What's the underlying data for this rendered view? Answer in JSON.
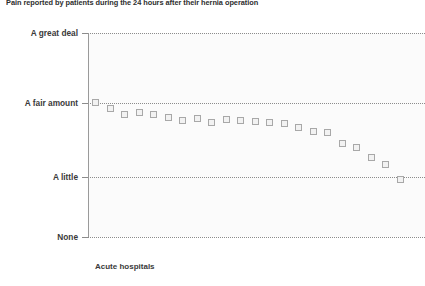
{
  "chart": {
    "title": "Pain reported by patients during the 24 hours after their hernia operation",
    "xlabel": "Acute hospitals"
  },
  "chart_data": {
    "type": "scatter",
    "title": "Pain reported by patients during the 24 hours after their hernia operation",
    "xlabel": "Acute hospitals",
    "ylabel": "",
    "grid": true,
    "legend": null,
    "y_categories": [
      "None",
      "A little",
      "A fair amount",
      "A great deal"
    ],
    "ylim": [
      0,
      3
    ],
    "y_tick_labels": [
      "A great deal",
      "A fair amount",
      "A little",
      "None"
    ],
    "y_tick_values": [
      3,
      2,
      1,
      0
    ],
    "marker": "square with 95% confidence interval whiskers",
    "x": [
      1,
      2,
      3,
      4,
      5,
      6,
      7,
      8,
      9,
      10,
      11,
      12,
      13,
      14,
      15,
      16,
      17,
      18,
      19,
      20,
      21,
      22
    ],
    "categories": [
      "Hospital 1",
      "Hospital 2",
      "Hospital 3",
      "Hospital 4",
      "Hospital 5",
      "Hospital 6",
      "Hospital 7",
      "Hospital 8",
      "Hospital 9",
      "Hospital 10",
      "Hospital 11",
      "Hospital 12",
      "Hospital 13",
      "Hospital 14",
      "Hospital 15",
      "Hospital 16",
      "Hospital 17",
      "Hospital 18",
      "Hospital 19",
      "Hospital 20",
      "Hospital 21",
      "Hospital 22"
    ],
    "series": [
      {
        "name": "Mean pain score",
        "values": [
          2.0,
          1.93,
          1.86,
          1.88,
          1.86,
          1.82,
          1.79,
          1.81,
          1.77,
          1.8,
          1.79,
          1.78,
          1.77,
          1.76,
          1.7,
          1.66,
          1.65,
          1.5,
          1.44,
          1.35,
          1.28,
          1.2
        ],
        "ci_low": [
          1.86,
          1.82,
          1.79,
          1.72,
          1.66,
          1.7,
          1.74,
          1.68,
          1.69,
          1.59,
          1.7,
          1.69,
          1.68,
          1.56,
          1.61,
          1.58,
          1.34,
          1.28,
          1.1,
          1.22,
          1.13
        ],
        "ci_high": [
          2.13,
          2.03,
          1.93,
          2.02,
          2.04,
          1.93,
          1.85,
          1.92,
          1.85,
          1.99,
          1.88,
          1.87,
          1.85,
          1.95,
          1.79,
          1.75,
          1.81,
          1.61,
          1.62,
          1.47,
          1.43,
          1.27
        ]
      }
    ]
  },
  "points": [
    {
      "x": 95,
      "mean": 103,
      "low": 92,
      "high": 114
    },
    {
      "x": 110,
      "mean": 109,
      "low": 100,
      "high": 117
    },
    {
      "x": 124,
      "mean": 115,
      "low": 109,
      "high": 121
    },
    {
      "x": 139,
      "mean": 113,
      "low": 99,
      "high": 125
    },
    {
      "x": 153,
      "mean": 115,
      "low": 96,
      "high": 132
    },
    {
      "x": 168,
      "mean": 118,
      "low": 108,
      "high": 128
    },
    {
      "x": 182,
      "mean": 121,
      "low": 114,
      "high": 126
    },
    {
      "x": 197,
      "mean": 119,
      "low": 110,
      "high": 130
    },
    {
      "x": 211,
      "mean": 123,
      "low": 115,
      "high": 129
    },
    {
      "x": 226,
      "mean": 120,
      "low": 103,
      "high": 137
    },
    {
      "x": 240,
      "mean": 121,
      "low": 113,
      "high": 128
    },
    {
      "x": 255,
      "mean": 122,
      "low": 114,
      "high": 130
    },
    {
      "x": 269,
      "mean": 123,
      "low": 115,
      "high": 130
    },
    {
      "x": 284,
      "mean": 124,
      "low": 107,
      "high": 140
    },
    {
      "x": 298,
      "mean": 128,
      "low": 119,
      "high": 137
    },
    {
      "x": 313,
      "mean": 132,
      "low": 124,
      "high": 140
    },
    {
      "x": 327,
      "mean": 133,
      "low": 113,
      "high": 152
    },
    {
      "x": 342,
      "mean": 144,
      "low": 136,
      "high": 152
    },
    {
      "x": 356,
      "mean": 148,
      "low": 139,
      "high": 157
    },
    {
      "x": 371,
      "mean": 158,
      "low": 146,
      "high": 170
    },
    {
      "x": 385,
      "mean": 165,
      "low": 152,
      "high": 181
    },
    {
      "x": 400,
      "mean": 180,
      "low": 172,
      "high": 192
    }
  ],
  "axis": {
    "y_labels": [
      {
        "text": "A great deal",
        "y": 33
      },
      {
        "text": "A fair amount",
        "y": 103
      },
      {
        "text": "A little",
        "y": 177
      },
      {
        "text": "None",
        "y": 237
      }
    ]
  }
}
